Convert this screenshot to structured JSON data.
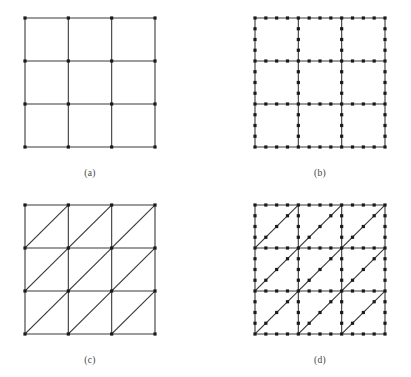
{
  "figure": {
    "caption_font_color": "#444444",
    "line_color": "#3a3a3a",
    "node_color": "#1a1a1a",
    "background_color": "#ffffff",
    "line_width": 1.1,
    "node_size": 3.2
  },
  "panels": [
    {
      "id": "a",
      "label": "(a)",
      "mesh_type": "quadrilateral",
      "element_order": "linear",
      "divisions": 3,
      "interior_edge_nodes": 0,
      "diagonal_direction": "none",
      "node_count": 16,
      "element_count": 9
    },
    {
      "id": "b",
      "label": "(b)",
      "mesh_type": "quadrilateral",
      "element_order": "higher-order",
      "divisions": 3,
      "interior_edge_nodes": 3,
      "diagonal_direction": "none",
      "node_count": 112,
      "element_count": 9
    },
    {
      "id": "c",
      "label": "(c)",
      "mesh_type": "triangular",
      "element_order": "linear",
      "divisions": 3,
      "interior_edge_nodes": 0,
      "diagonal_direction": "bottom-left-to-top-right",
      "node_count": 16,
      "element_count": 18
    },
    {
      "id": "d",
      "label": "(d)",
      "mesh_type": "triangular",
      "element_order": "higher-order",
      "divisions": 3,
      "interior_edge_nodes": 3,
      "diagonal_direction": "bottom-left-to-top-right",
      "node_count": 139,
      "element_count": 18
    }
  ],
  "chart_data": {
    "type": "diagram",
    "title": "",
    "subtitle": "",
    "panel_labels": [
      "(a)",
      "(b)",
      "(c)",
      "(d)"
    ],
    "domain_extent": {
      "x": [
        0,
        3
      ],
      "y": [
        0,
        3
      ]
    },
    "grid_lines": {
      "vertical_x": [
        0,
        1,
        2,
        3
      ],
      "horizontal_y": [
        0,
        1,
        2,
        3
      ]
    },
    "series": [
      {
        "name": "(a) linear quadrilateral mesh",
        "edges": "4 vertical + 4 horizontal grid lines",
        "nodes_x": [
          0,
          1,
          2,
          3
        ],
        "nodes_y": [
          0,
          1,
          2,
          3
        ],
        "values": [
          16,
          9
        ]
      },
      {
        "name": "(b) higher-order quadrilateral mesh",
        "edges": "4 vertical + 4 horizontal grid lines",
        "nodes_x": [
          0,
          0.25,
          0.5,
          0.75,
          1,
          1.25,
          1.5,
          1.75,
          2,
          2.25,
          2.5,
          2.75,
          3
        ],
        "nodes_y": [
          0,
          0.25,
          0.5,
          0.75,
          1,
          1.25,
          1.5,
          1.75,
          2,
          2.25,
          2.5,
          2.75,
          3
        ],
        "values": [
          112,
          9
        ]
      },
      {
        "name": "(c) linear triangular mesh",
        "edges": "4 vertical + 4 horizontal grid lines + 9 cell diagonals",
        "nodes_x": [
          0,
          1,
          2,
          3
        ],
        "nodes_y": [
          0,
          1,
          2,
          3
        ],
        "values": [
          16,
          18
        ]
      },
      {
        "name": "(d) higher-order triangular mesh",
        "edges": "4 vertical + 4 horizontal grid lines + 9 cell diagonals",
        "nodes_x": [
          0,
          0.25,
          0.5,
          0.75,
          1,
          1.25,
          1.5,
          1.75,
          2,
          2.25,
          2.5,
          2.75,
          3
        ],
        "nodes_y": [
          0,
          0.25,
          0.5,
          0.75,
          1,
          1.25,
          1.5,
          1.75,
          2,
          2.25,
          2.5,
          2.75,
          3
        ],
        "values": [
          139,
          18
        ]
      }
    ],
    "xlabel": "",
    "ylabel": "",
    "legend_position": "none",
    "grid": false
  }
}
